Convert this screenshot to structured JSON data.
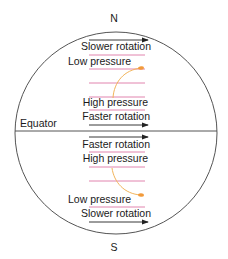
{
  "diagram": {
    "poles": {
      "north": "N",
      "south": "S"
    },
    "equator_label": "Equator",
    "northern_hemisphere": {
      "top_arrow_label": "Slower rotation",
      "low_label": "Low pressure",
      "high_label": "High pressure",
      "bottom_arrow_label": "Faster rotation"
    },
    "southern_hemisphere": {
      "top_arrow_label": "Faster rotation",
      "high_label": "High pressure",
      "low_label": "Low pressure",
      "bottom_arrow_label": "Slower rotation"
    },
    "colors": {
      "outline": "#555555",
      "isobar": "#d9669a",
      "flow_path": "#f2b45a",
      "arrow": "#222222",
      "text": "#1a1a1a"
    }
  }
}
